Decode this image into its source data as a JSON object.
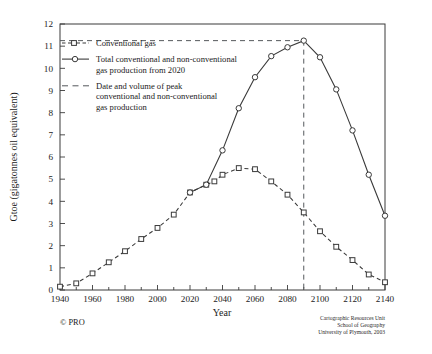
{
  "chart_data": {
    "type": "line",
    "title": "",
    "xlabel": "Year",
    "ylabel": "Gtoe (gigatonnes oil equivalent)",
    "xlim": [
      1940,
      2140
    ],
    "ylim": [
      0,
      12
    ],
    "xticks": [
      1940,
      1960,
      1980,
      2000,
      2020,
      2040,
      2060,
      2080,
      2100,
      2120,
      2140
    ],
    "xtick_labels": [
      "1940",
      "1960",
      "1980",
      "2000",
      "2020",
      "2040",
      "2060",
      "2080",
      "2100",
      "2120",
      "2140"
    ],
    "xtick_minor_step": 10,
    "yticks": [
      0,
      1,
      2,
      3,
      4,
      5,
      6,
      7,
      8,
      9,
      10,
      11,
      12
    ],
    "ytick_labels": [
      "0",
      "1",
      "2",
      "3",
      "4",
      "5",
      "6",
      "7",
      "8",
      "9",
      "10",
      "11",
      "12"
    ],
    "grid": false,
    "legend_position": "upper-left-inside",
    "series": [
      {
        "name": "Conventional gas",
        "marker": "square",
        "linestyle": "dashed",
        "color": "#3a3a3a",
        "x": [
          1940,
          1950,
          1960,
          1970,
          1980,
          1990,
          2000,
          2010,
          2020,
          2030,
          2035,
          2040,
          2050,
          2060,
          2070,
          2080,
          2090,
          2100,
          2110,
          2120,
          2130,
          2140
        ],
        "values": [
          0.15,
          0.3,
          0.75,
          1.25,
          1.75,
          2.3,
          2.8,
          3.4,
          4.4,
          4.75,
          4.9,
          5.2,
          5.5,
          5.45,
          4.9,
          4.3,
          3.5,
          2.65,
          1.95,
          1.35,
          0.7,
          0.35
        ]
      },
      {
        "name": "Total conventional and non-conventional gas production from 2020",
        "marker": "circle",
        "linestyle": "solid",
        "color": "#3a3a3a",
        "x": [
          2020,
          2030,
          2040,
          2050,
          2060,
          2070,
          2080,
          2090,
          2100,
          2110,
          2120,
          2130,
          2140
        ],
        "values": [
          4.4,
          4.75,
          6.3,
          8.2,
          9.6,
          10.55,
          10.95,
          11.25,
          10.5,
          9.05,
          7.2,
          5.2,
          3.35
        ]
      }
    ],
    "annotations": [
      {
        "name": "peak-reference-lines",
        "type": "peak-marker",
        "x": 2090,
        "y": 11.25,
        "label": "Date and volume of peak conventional and non-conventional gas production"
      }
    ],
    "legend": [
      {
        "key": "conventional-gas",
        "marker": "square",
        "linestyle": "dashed",
        "lines": [
          "Conventional gas"
        ]
      },
      {
        "key": "total-gas",
        "marker": "circle",
        "linestyle": "solid",
        "lines": [
          "Total conventional and non-conventional",
          "gas production from 2020"
        ]
      },
      {
        "key": "peak-date-volume",
        "marker": "none",
        "linestyle": "dashed",
        "lines": [
          "Date and volume of peak",
          "conventional and non-conventional",
          "gas production"
        ]
      }
    ]
  },
  "footer": {
    "copyright": "© PRO",
    "credit_lines": [
      "Cartographic Resources Unit",
      "School of Geography",
      "University of Plymouth, 2003"
    ]
  },
  "colors": {
    "ink": "#3a3a3a",
    "text": "#1b1b1b",
    "reference": "#55585c",
    "background": "#ffffff"
  }
}
